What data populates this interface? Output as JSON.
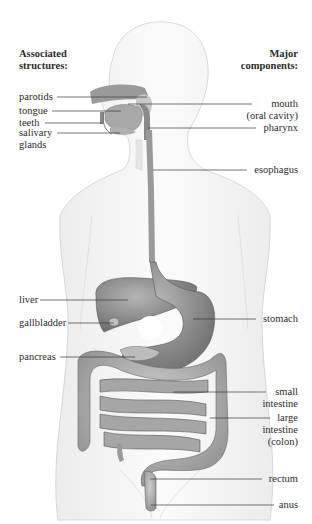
{
  "diagram": {
    "title_left": [
      "Associated",
      "structures:"
    ],
    "title_right": [
      "Major",
      "components:"
    ],
    "left_labels": [
      {
        "id": "parotids",
        "lines": [
          "parotids"
        ]
      },
      {
        "id": "tongue",
        "lines": [
          "tongue"
        ]
      },
      {
        "id": "teeth",
        "lines": [
          "teeth"
        ]
      },
      {
        "id": "salivary-glands",
        "lines": [
          "salivary",
          "glands"
        ]
      },
      {
        "id": "liver",
        "lines": [
          "liver"
        ]
      },
      {
        "id": "gallbladder",
        "lines": [
          "gallbladder"
        ]
      },
      {
        "id": "pancreas",
        "lines": [
          "pancreas"
        ]
      }
    ],
    "right_labels": [
      {
        "id": "mouth",
        "lines": [
          "mouth",
          "(oral cavity)"
        ]
      },
      {
        "id": "pharynx",
        "lines": [
          "pharynx"
        ]
      },
      {
        "id": "esophagus",
        "lines": [
          "esophagus"
        ]
      },
      {
        "id": "stomach",
        "lines": [
          "stomach"
        ]
      },
      {
        "id": "small-intestine",
        "lines": [
          "small",
          "intestine"
        ]
      },
      {
        "id": "large-intestine",
        "lines": [
          "large",
          "intestine",
          "(colon)"
        ]
      },
      {
        "id": "rectum",
        "lines": [
          "rectum"
        ]
      },
      {
        "id": "anus",
        "lines": [
          "anus"
        ]
      }
    ],
    "colors": {
      "organ": "#8a8a8a",
      "organ_dark": "#5e5e5e",
      "body_outline": "#c8c8c8",
      "leader_line": "#3a3a3a"
    }
  }
}
